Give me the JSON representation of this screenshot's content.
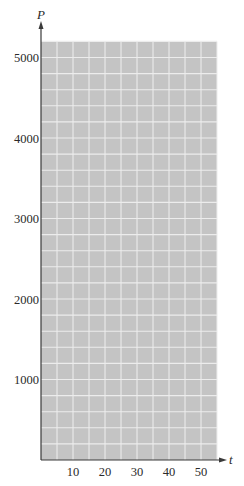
{
  "chart_data": {
    "type": "line",
    "title": "",
    "xlabel": "t",
    "ylabel": "P",
    "xlim": [
      0,
      55
    ],
    "ylim": [
      0,
      5200
    ],
    "x_ticks": [
      10,
      20,
      30,
      40,
      50
    ],
    "x_tick_labels": [
      "10",
      "20",
      "30",
      "40",
      "50"
    ],
    "y_ticks": [
      1000,
      2000,
      3000,
      4000,
      5000
    ],
    "y_tick_labels": [
      "1000",
      "2000",
      "3000",
      "4000",
      "5000"
    ],
    "grid": true,
    "grid_x_step": 5,
    "grid_y_step": 200,
    "series": [],
    "legend": null,
    "colors": {
      "grid_background": "#c4c4c4",
      "grid_lines": "#ececec",
      "axis": "#3a3a3a"
    }
  },
  "axes": {
    "x_label": "t",
    "y_label": "P"
  }
}
